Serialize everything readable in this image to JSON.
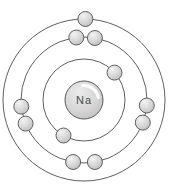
{
  "diagram": {
    "type": "bohr-atom-model",
    "background": "#ffffff",
    "center": {
      "x": 84,
      "y": 100
    },
    "nucleus": {
      "label": "Na",
      "radius": 19,
      "fill_light": "#ebebeb",
      "fill_mid": "#d6d6d6",
      "fill_dark": "#bfbfbf",
      "stroke": "#595959",
      "label_color": "#4d4d4d",
      "highlight_color": "#ffffff"
    },
    "orbit_stroke": "#5f5f5f",
    "electron": {
      "radius": 7.5,
      "fill_light": "#f3f3f3",
      "fill_mid": "#d8d8d8",
      "fill_dark": "#bdbdbd",
      "stroke": "#5f5f5f"
    },
    "shells": [
      {
        "radius": 41,
        "electron_count": 2,
        "electron_angles_deg": [
          42,
          240
        ]
      },
      {
        "radius": 63,
        "electron_count": 8,
        "electron_angles_deg": [
          97,
          80,
          186,
          202,
          -5,
          -21,
          -100,
          -80
        ]
      },
      {
        "radius": 81,
        "electron_count": 1,
        "electron_angles_deg": [
          89
        ]
      }
    ],
    "total_electrons": 11
  }
}
